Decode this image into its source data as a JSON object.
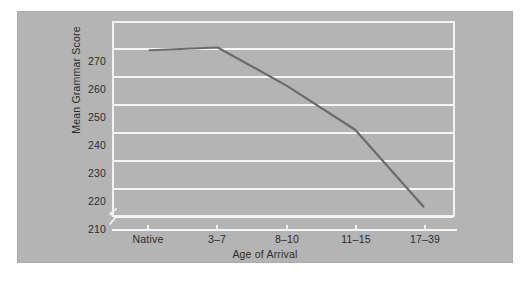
{
  "chart_data": {
    "type": "line",
    "title": "",
    "xlabel": "Age of Arrival",
    "ylabel": "Mean Grammar Score",
    "categories": [
      "Native",
      "3–7",
      "8–10",
      "11–15",
      "17–39"
    ],
    "values": [
      269,
      270,
      256,
      240,
      212
    ],
    "series": [
      {
        "name": "Mean Grammar Score",
        "values": [
          269,
          270,
          256,
          240,
          212
        ]
      }
    ],
    "ylim": [
      205,
      274
    ],
    "yticks": [
      210,
      220,
      230,
      240,
      250,
      260,
      270
    ],
    "ytick_labels": [
      "210",
      "220",
      "230",
      "240",
      "250",
      "260",
      "270"
    ],
    "xtick_labels": [
      "Native",
      "3–7",
      "8–10",
      "11–15",
      "17–39"
    ],
    "grid": "horizontal",
    "legend": "none",
    "y_axis_break": true,
    "annotations": []
  },
  "style": {
    "panel_background": "#b4b4b4",
    "page_background": "#ffffff",
    "gridline_color": "#f7f7f7",
    "frame_color": "#f2f2f2",
    "line_color": "#6b6b6b",
    "text_color": "#2c2c2c"
  },
  "icons": {
    "axis_break": "axis-break-zigzag"
  }
}
